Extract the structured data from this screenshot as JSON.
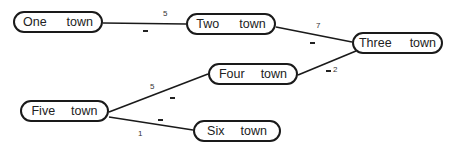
{
  "diagram": {
    "type": "weighted-graph",
    "nodes": [
      {
        "id": "one",
        "word1": "One",
        "word2": "town",
        "x": 13,
        "y": 11,
        "w": 90,
        "gap": 20
      },
      {
        "id": "two",
        "word1": "Two",
        "word2": "town",
        "x": 186,
        "y": 13,
        "w": 90,
        "gap": 20
      },
      {
        "id": "three",
        "word1": "Three",
        "word2": "town",
        "x": 352,
        "y": 32,
        "w": 91,
        "gap": 18
      },
      {
        "id": "four",
        "word1": "Four",
        "word2": "town",
        "x": 208,
        "y": 63,
        "w": 90,
        "gap": 16
      },
      {
        "id": "five",
        "word1": "Five",
        "word2": "town",
        "x": 20,
        "y": 100,
        "w": 89,
        "gap": 16
      },
      {
        "id": "six",
        "word1": "Six",
        "word2": "town",
        "x": 193,
        "y": 120,
        "w": 88,
        "gap": 16
      }
    ],
    "edges": [
      {
        "from": "One town",
        "to": "Two town",
        "weight": "5",
        "x1": 103,
        "y1": 23,
        "x2": 186,
        "y2": 24,
        "label_x": 163,
        "label_y": 10,
        "dash_x": 143,
        "dash_y": 30
      },
      {
        "from": "Two town",
        "to": "Three town",
        "weight": "7",
        "x1": 276,
        "y1": 27,
        "x2": 352,
        "y2": 42,
        "label_x": 316,
        "label_y": 22,
        "dash_x": 310,
        "dash_y": 42
      },
      {
        "from": "Four town",
        "to": "Three town",
        "weight": "2",
        "x1": 298,
        "y1": 75,
        "x2": 356,
        "y2": 51,
        "label_x": 333,
        "label_y": 66,
        "dash_x": 326,
        "dash_y": 70
      },
      {
        "from": "Five town",
        "to": "Four town",
        "weight": "5",
        "x1": 109,
        "y1": 112,
        "x2": 208,
        "y2": 74,
        "label_x": 150,
        "label_y": 83,
        "dash_x": 170,
        "dash_y": 97
      },
      {
        "from": "Five town",
        "to": "Six town",
        "weight": "1",
        "x1": 109,
        "y1": 117,
        "x2": 193,
        "y2": 130,
        "label_x": 138,
        "label_y": 130,
        "dash_x": 158,
        "dash_y": 119
      }
    ],
    "colors": {
      "stroke": "#1a1a1a",
      "text": "#222222",
      "label": "#333333",
      "background": "#ffffff"
    }
  }
}
